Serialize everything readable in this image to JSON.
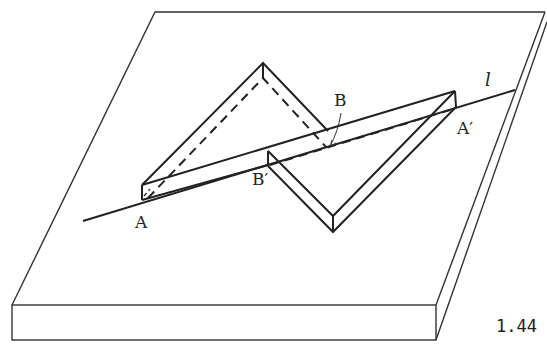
{
  "figure": {
    "number": "1.44",
    "labels": {
      "A": "A",
      "A_prime": "A′",
      "B": "B",
      "B_prime": "B′",
      "line": "l"
    },
    "colors": {
      "stroke": "#222222",
      "background": "#ffffff"
    }
  }
}
